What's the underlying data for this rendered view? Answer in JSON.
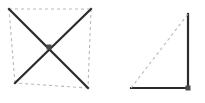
{
  "canvas": {
    "width": 205,
    "height": 103,
    "background": "#ffffff"
  },
  "style": {
    "solid_color": "#2b2b2b",
    "dashed_color": "#b9b9b9",
    "marker_color": "#4a4a4a",
    "solid_width": 2.2,
    "dashed_width": 1.1,
    "dash_pattern": "3,3"
  },
  "figures": [
    {
      "id": "quadrilateral-with-diagonals",
      "name": "Quadrilateral with diagonals",
      "vertices": {
        "top_left": {
          "label": "A",
          "x": 9,
          "y": 9
        },
        "top_right": {
          "label": "B",
          "x": 91,
          "y": 9
        },
        "bottom_right": {
          "label": "C",
          "x": 88,
          "y": 88
        },
        "bottom_left": {
          "label": "D",
          "x": 15,
          "y": 83
        }
      },
      "edges": [
        {
          "name": "edge-top",
          "from": "top_left",
          "to": "top_right",
          "style": "dashed"
        },
        {
          "name": "edge-right",
          "from": "top_right",
          "to": "bottom_right",
          "style": "dashed"
        },
        {
          "name": "edge-bottom",
          "from": "bottom_right",
          "to": "bottom_left",
          "style": "dashed"
        },
        {
          "name": "edge-left",
          "from": "bottom_left",
          "to": "top_left",
          "style": "dashed"
        }
      ],
      "diagonals": [
        {
          "name": "diagonal-a-c",
          "from": "top_left",
          "to": "bottom_right",
          "style": "solid"
        },
        {
          "name": "diagonal-b-d",
          "from": "top_right",
          "to": "bottom_left",
          "style": "solid"
        }
      ],
      "markers": [
        {
          "name": "diagonal-intersection-point",
          "x": 49,
          "y": 47,
          "size": 5,
          "shape": "square"
        }
      ]
    },
    {
      "id": "right-triangle",
      "name": "Right triangle",
      "vertices": {
        "apex_top": {
          "label": "P",
          "x": 188,
          "y": 14
        },
        "right_angle": {
          "label": "Q",
          "x": 188,
          "y": 88
        },
        "left_base": {
          "label": "R",
          "x": 131,
          "y": 88
        }
      },
      "edges": [
        {
          "name": "leg-vertical",
          "from": "apex_top",
          "to": "right_angle",
          "style": "solid"
        },
        {
          "name": "leg-horizontal",
          "from": "right_angle",
          "to": "left_base",
          "style": "solid"
        },
        {
          "name": "hypotenuse",
          "from": "left_base",
          "to": "apex_top",
          "style": "dashed"
        }
      ],
      "markers": [
        {
          "name": "right-angle-vertex-point",
          "x": 188,
          "y": 88,
          "size": 5,
          "shape": "square"
        }
      ]
    }
  ]
}
